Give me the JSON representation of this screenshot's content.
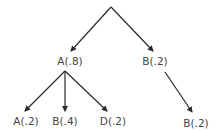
{
  "diagram": {
    "type": "tree",
    "colors": {
      "edge": "#2b2b2b",
      "label": "#444444",
      "background": "#ffffff"
    },
    "root": {
      "id": "root",
      "label": ""
    },
    "nodes": [
      {
        "id": "n1",
        "label": "A(.8)",
        "parent": "root"
      },
      {
        "id": "n2",
        "label": "B(.2)",
        "parent": "root"
      },
      {
        "id": "n3",
        "label": "A(.2)",
        "parent": "n1"
      },
      {
        "id": "n4",
        "label": "B(.4)",
        "parent": "n1"
      },
      {
        "id": "n5",
        "label": "D(.2)",
        "parent": "n1"
      },
      {
        "id": "n6",
        "label": "B(.2)",
        "parent": "n2"
      }
    ]
  }
}
